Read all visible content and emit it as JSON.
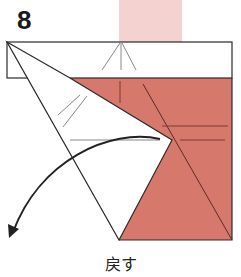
{
  "diagram": {
    "step_number": "8",
    "caption": "戻す",
    "colors": {
      "paper_colored": "#d6786c",
      "paper_back_faint": "#f4d2cf",
      "paper_white": "#ffffff",
      "outline": "#2a2a2a",
      "crease": "#7a3a34"
    },
    "icons": [
      "curved-arrow-icon"
    ]
  }
}
